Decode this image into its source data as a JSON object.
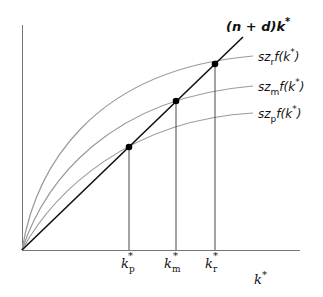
{
  "diagram": {
    "type": "economics-solow-steady-state",
    "x_axis_label": "k",
    "x_axis_label_sup": "*",
    "line": {
      "label_prefix": "(n + d)k",
      "label_sup": "*",
      "color": "#111111"
    },
    "curves": [
      {
        "id": "r",
        "label_pre": "sz",
        "label_sub": "r",
        "label_mid": "f(k",
        "label_sup": "*",
        "label_post": ")",
        "color": "#999999"
      },
      {
        "id": "m",
        "label_pre": "sz",
        "label_sub": "m",
        "label_mid": "f(k",
        "label_sup": "*",
        "label_post": ")",
        "color": "#999999"
      },
      {
        "id": "p",
        "label_pre": "sz",
        "label_sub": "p",
        "label_mid": "f(k",
        "label_sup": "*",
        "label_post": ")",
        "color": "#999999"
      }
    ],
    "steady_states": [
      {
        "id": "p",
        "label": "k",
        "sup": "*",
        "sub": "p"
      },
      {
        "id": "m",
        "label": "k",
        "sup": "*",
        "sub": "m"
      },
      {
        "id": "r",
        "label": "k",
        "sup": "*",
        "sub": "r"
      }
    ]
  }
}
